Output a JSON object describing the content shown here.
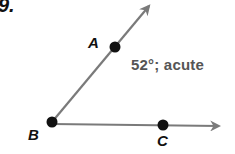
{
  "problem": {
    "number": "9."
  },
  "points": [
    {
      "name": "A",
      "x": 115,
      "y": 47
    },
    {
      "name": "B",
      "x": 52,
      "y": 122
    },
    {
      "name": "C",
      "x": 163,
      "y": 125
    }
  ],
  "labels": {
    "A": "A",
    "B": "B",
    "C": "C"
  },
  "answer": {
    "text": "52°; acute",
    "angle_deg": 52,
    "classification": "acute"
  },
  "colors": {
    "ray": "#7a7a7a",
    "point": "#111111",
    "answer_text": "#555555"
  }
}
